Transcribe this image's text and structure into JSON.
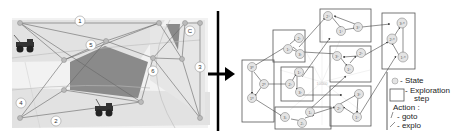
{
  "left_map": {
    "region_labels": [
      "1",
      "2",
      "3",
      "4",
      "5",
      "6",
      "C"
    ],
    "background_color": "#e4e4e4",
    "obstacle_color": "#8a8a8a"
  },
  "arrow": {
    "direction": "right"
  },
  "graph": {
    "state_labels": {
      "a1": "1⁰",
      "a2": "2⁰",
      "a3": "3⁰",
      "b1": "1¹",
      "b2": "2¹",
      "b3": "3¹",
      "c1": "1²",
      "c2": "2²",
      "c3": "3²",
      "d1": "1³",
      "d2": "2³",
      "d3": "3³",
      "e1": "1⁴",
      "e2": "2⁴",
      "e3": "3⁴",
      "f1": "1⁵",
      "f2": "2⁵",
      "f3": "3⁵",
      "g1": "1⁶",
      "g2": "2⁶",
      "g3": "3⁶",
      "h1": "1¹⁰",
      "h2": "2¹⁰",
      "h3": "3¹⁰",
      "center": "10000"
    }
  },
  "legend": {
    "state_symbol": "①",
    "state_label": "- State",
    "exploration_label_1": "- Exploration",
    "exploration_label_2": "step",
    "action_title": "Action :",
    "goto_label": "- goto",
    "explo_label": "- explo"
  }
}
